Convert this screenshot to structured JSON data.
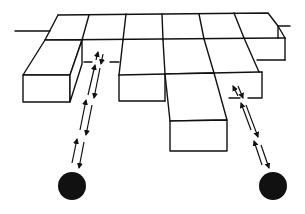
{
  "diagram": {
    "colors": {
      "line": "#111111",
      "background": "#ffffff",
      "source": "#111111"
    },
    "sources": [
      {
        "name": "left-source",
        "cx": 72,
        "cy": 186,
        "r": 14
      },
      {
        "name": "right-source",
        "cx": 273,
        "cy": 186,
        "r": 14
      }
    ],
    "ray_paths": [
      {
        "name": "left-ray-path",
        "from": [
          72,
          172
        ],
        "to": [
          99,
          52
        ]
      },
      {
        "name": "right-ray-path",
        "from": [
          273,
          172
        ],
        "to": [
          235,
          87
        ]
      }
    ]
  }
}
